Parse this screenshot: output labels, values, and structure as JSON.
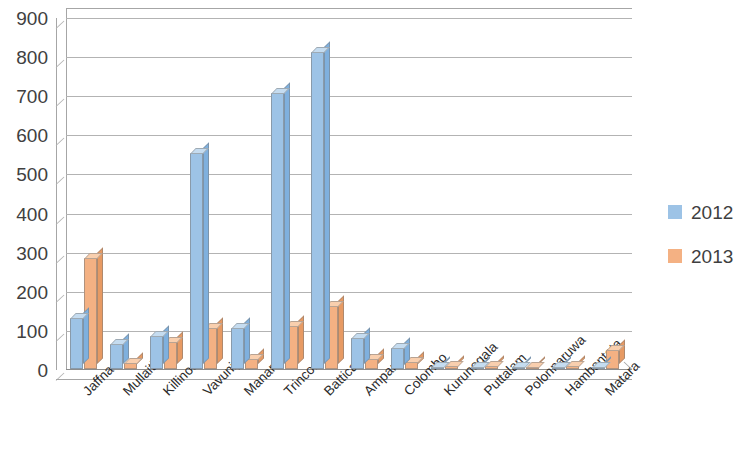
{
  "chart_data": {
    "type": "bar",
    "title": "",
    "subtitle": "",
    "xlabel": "",
    "ylabel": "",
    "ylim": [
      0,
      900
    ],
    "y_ticks": [
      0,
      100,
      200,
      300,
      400,
      500,
      600,
      700,
      800,
      900
    ],
    "grid": true,
    "legend_position": "right",
    "categories": [
      "Jaffna",
      "Mullaitivu",
      "Killinochchi",
      "Vavuniya",
      "Manar",
      "Trincomalee",
      "Batticaloa",
      "Ampara",
      "Colombo",
      "Kurunegala",
      "Puttalam",
      "Polonnaruwa",
      "Hambantota",
      "Matara"
    ],
    "series": [
      {
        "name": "2012",
        "color": "#9dc3e6",
        "values": [
          130,
          65,
          85,
          553,
          105,
          705,
          810,
          80,
          55,
          5,
          4,
          4,
          4,
          5
        ]
      },
      {
        "name": "2013",
        "color": "#f4b183",
        "values": [
          283,
          15,
          70,
          105,
          25,
          110,
          160,
          25,
          18,
          8,
          8,
          6,
          8,
          48
        ]
      }
    ]
  },
  "legend": {
    "items": [
      {
        "label": "2012",
        "color": "#9dc3e6"
      },
      {
        "label": "2013",
        "color": "#f4b183"
      }
    ]
  }
}
